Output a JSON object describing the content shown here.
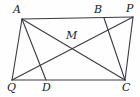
{
  "figure": {
    "stroke_color": "#3a3a42",
    "label_color": "#1b1b1b",
    "background_color": "#fefefe",
    "width": 140,
    "height": 97
  },
  "points": {
    "A": {
      "label": "A",
      "x": 22,
      "y": 19,
      "label_x": 13,
      "label_y": 4
    },
    "B": {
      "label": "B",
      "x": 104,
      "y": 18,
      "label_x": 94,
      "label_y": 4
    },
    "P": {
      "label": "P",
      "x": 133,
      "y": 17,
      "label_x": 126,
      "label_y": 3
    },
    "M": {
      "label": "M",
      "x": 73,
      "y": 45,
      "label_x": 66,
      "label_y": 30
    },
    "Q": {
      "label": "Q",
      "x": 12,
      "y": 80,
      "label_x": 7,
      "label_y": 82
    },
    "D": {
      "label": "D",
      "x": 46,
      "y": 80,
      "label_x": 42,
      "label_y": 82
    },
    "C": {
      "label": "C",
      "x": 125,
      "y": 80,
      "label_x": 122,
      "label_y": 82
    }
  },
  "segments": [
    {
      "name": "side-AP",
      "from": "A",
      "to": "P"
    },
    {
      "name": "side-QC",
      "from": "Q",
      "to": "C"
    },
    {
      "name": "side-AQ",
      "from": "A",
      "to": "Q"
    },
    {
      "name": "side-PC",
      "from": "P",
      "to": "C"
    },
    {
      "name": "diagonal-AC",
      "from": "A",
      "to": "C"
    },
    {
      "name": "diagonal-QP",
      "from": "Q",
      "to": "P"
    },
    {
      "name": "cevian-AD",
      "from": "A",
      "to": "D"
    },
    {
      "name": "cevian-BC",
      "from": "B",
      "to": "C"
    }
  ],
  "labels_order": [
    "A",
    "B",
    "P",
    "M",
    "Q",
    "D",
    "C"
  ]
}
